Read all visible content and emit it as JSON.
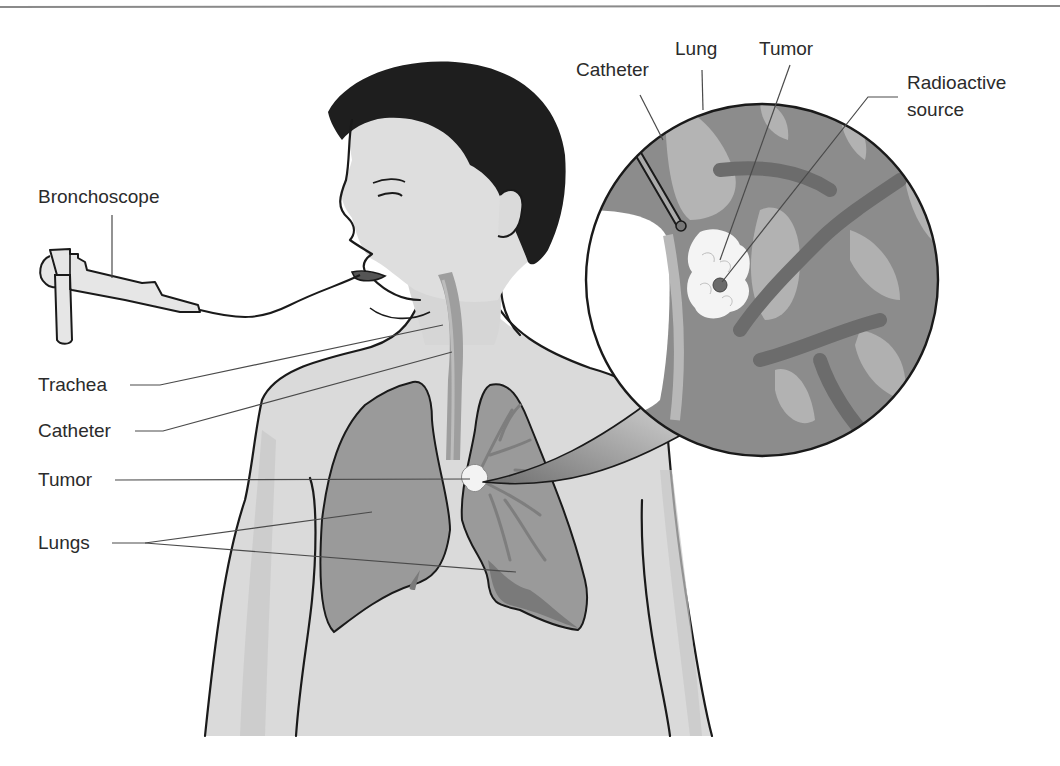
{
  "figure": {
    "colors": {
      "skin": "#dcdcdc",
      "skin_shade": "#c4c4c4",
      "hair": "#1e1e1e",
      "lung": "#9a9a9a",
      "lung_dark": "#7e7e7e",
      "tumor": "#f2f2f2",
      "inset_bg": "#8c8c8c",
      "inset_light": "#b4b4b4",
      "line": "#1a1a1a"
    }
  },
  "labels": {
    "bronchoscope": "Bronchoscope",
    "trachea": "Trachea",
    "catheter": "Catheter",
    "tumor": "Tumor",
    "lungs": "Lungs"
  },
  "inset_labels": {
    "catheter": "Catheter",
    "lung": "Lung",
    "tumor": "Tumor",
    "radioactive_source_line1": "Radioactive",
    "radioactive_source_line2": "source"
  }
}
